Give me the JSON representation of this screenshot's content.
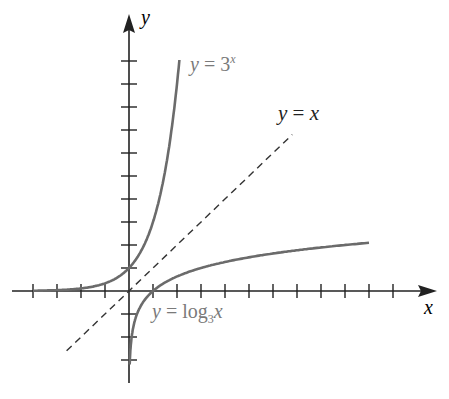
{
  "chart_data": {
    "type": "line",
    "title": "",
    "xlabel": "x",
    "ylabel": "y",
    "grid": false,
    "x_ticks": [
      -4,
      -3,
      -2,
      -1,
      1,
      2,
      3,
      4,
      5,
      6,
      7,
      8,
      9,
      10,
      11
    ],
    "y_ticks": [
      -3,
      -2,
      -1,
      1,
      2,
      3,
      4,
      5,
      6,
      7,
      8,
      9,
      10
    ],
    "xlim": [
      -5,
      13
    ],
    "ylim": [
      -4,
      11
    ],
    "series": [
      {
        "name": "y = 3^x",
        "color": "#6b6b6b",
        "style": "solid",
        "function": "3^x",
        "x_range": [
          -4,
          2.1
        ]
      },
      {
        "name": "y = x",
        "color": "#333333",
        "style": "dashed",
        "function": "x",
        "x_range": [
          -2.6,
          6.8
        ]
      },
      {
        "name": "y = log3 x",
        "color": "#6b6b6b",
        "style": "solid",
        "function": "log3(x)",
        "x_range": [
          0.03,
          10
        ]
      }
    ],
    "annotations": [
      "y = 3^x",
      "y = x",
      "y = log3 x"
    ]
  },
  "labels": {
    "x_axis": "x",
    "y_axis": "y",
    "exp": {
      "lhs": "y",
      "eq": " = ",
      "base": "3",
      "exp": "x"
    },
    "identity": {
      "lhs": "y",
      "eq": " = ",
      "rhs": "x"
    },
    "log": {
      "lhs": "y",
      "eq": " = ",
      "fn": "log",
      "base": "3",
      "arg": "x"
    }
  }
}
